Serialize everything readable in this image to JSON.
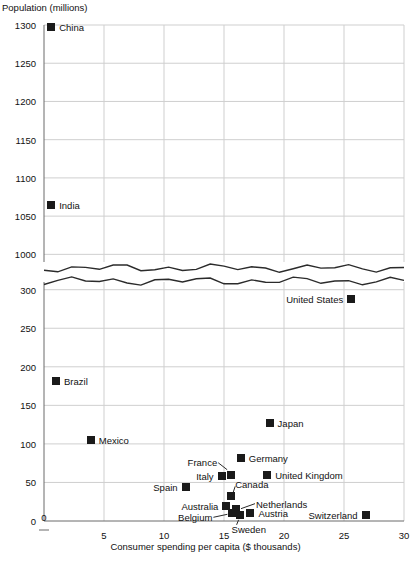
{
  "chart_data": {
    "type": "scatter",
    "title": "",
    "ylabel": "Population (millions)",
    "xlabel": "Consumer spending per capita ($ thousands)",
    "xlim": [
      0,
      30
    ],
    "xticks": [
      0,
      5,
      10,
      15,
      20,
      25,
      30
    ],
    "xticklabels": [
      "0",
      "5",
      "10",
      "15",
      "20",
      "25",
      "30"
    ],
    "grid": true,
    "legend": "none",
    "broken_axis": {
      "present": true,
      "lower_range": [
        0,
        310
      ],
      "upper_range": [
        990,
        1300
      ],
      "note": "zigzag axis break between lower and upper panels"
    },
    "yticks_lower": [
      0,
      50,
      100,
      150,
      200,
      250,
      300
    ],
    "yticklabels_lower": [
      "0",
      "50",
      "100",
      "150",
      "200",
      "250",
      "300"
    ],
    "yticks_upper": [
      1000,
      1050,
      1100,
      1150,
      1200,
      1250,
      1300
    ],
    "yticklabels_upper": [
      "1000",
      "1050",
      "1100",
      "1150",
      "1200",
      "1250",
      "1300"
    ],
    "marker_color": "#1a1a1a",
    "marker_shape": "square",
    "points": [
      {
        "label": "China",
        "x": 0.6,
        "y": 1297,
        "panel": "upper",
        "label_side": "right"
      },
      {
        "label": "India",
        "x": 0.6,
        "y": 1064,
        "panel": "upper",
        "label_side": "right"
      },
      {
        "label": "United States",
        "x": 25.6,
        "y": 288,
        "panel": "lower",
        "label_side": "left"
      },
      {
        "label": "Brazil",
        "x": 1.0,
        "y": 181,
        "panel": "lower",
        "label_side": "right"
      },
      {
        "label": "Japan",
        "x": 18.8,
        "y": 127,
        "panel": "lower",
        "label_side": "right"
      },
      {
        "label": "Mexico",
        "x": 3.9,
        "y": 105,
        "panel": "lower",
        "label_side": "right"
      },
      {
        "label": "Germany",
        "x": 16.4,
        "y": 82,
        "panel": "lower",
        "label_side": "right"
      },
      {
        "label": "United Kingdom",
        "x": 18.6,
        "y": 60,
        "panel": "lower",
        "label_side": "right"
      },
      {
        "label": "France",
        "x": 15.6,
        "y": 60,
        "panel": "lower",
        "label_side": "leader-up-left"
      },
      {
        "label": "Italy",
        "x": 14.8,
        "y": 58,
        "panel": "lower",
        "label_side": "left"
      },
      {
        "label": "Spain",
        "x": 11.8,
        "y": 44,
        "panel": "lower",
        "label_side": "left"
      },
      {
        "label": "Canada",
        "x": 15.6,
        "y": 32,
        "panel": "lower",
        "label_side": "leader-up-right"
      },
      {
        "label": "Australia",
        "x": 15.2,
        "y": 20,
        "panel": "lower",
        "label_side": "left"
      },
      {
        "label": "Netherlands",
        "x": 16.0,
        "y": 16,
        "panel": "lower",
        "label_side": "leader-right"
      },
      {
        "label": "Belgium",
        "x": 15.7,
        "y": 10,
        "panel": "lower",
        "label_side": "leader-left"
      },
      {
        "label": "Sweden",
        "x": 16.3,
        "y": 8,
        "panel": "lower",
        "label_side": "leader-down"
      },
      {
        "label": "Austria",
        "x": 17.2,
        "y": 10,
        "panel": "lower",
        "label_side": "right"
      },
      {
        "label": "Switzerland",
        "x": 26.8,
        "y": 8,
        "panel": "lower",
        "label_side": "left"
      }
    ]
  }
}
